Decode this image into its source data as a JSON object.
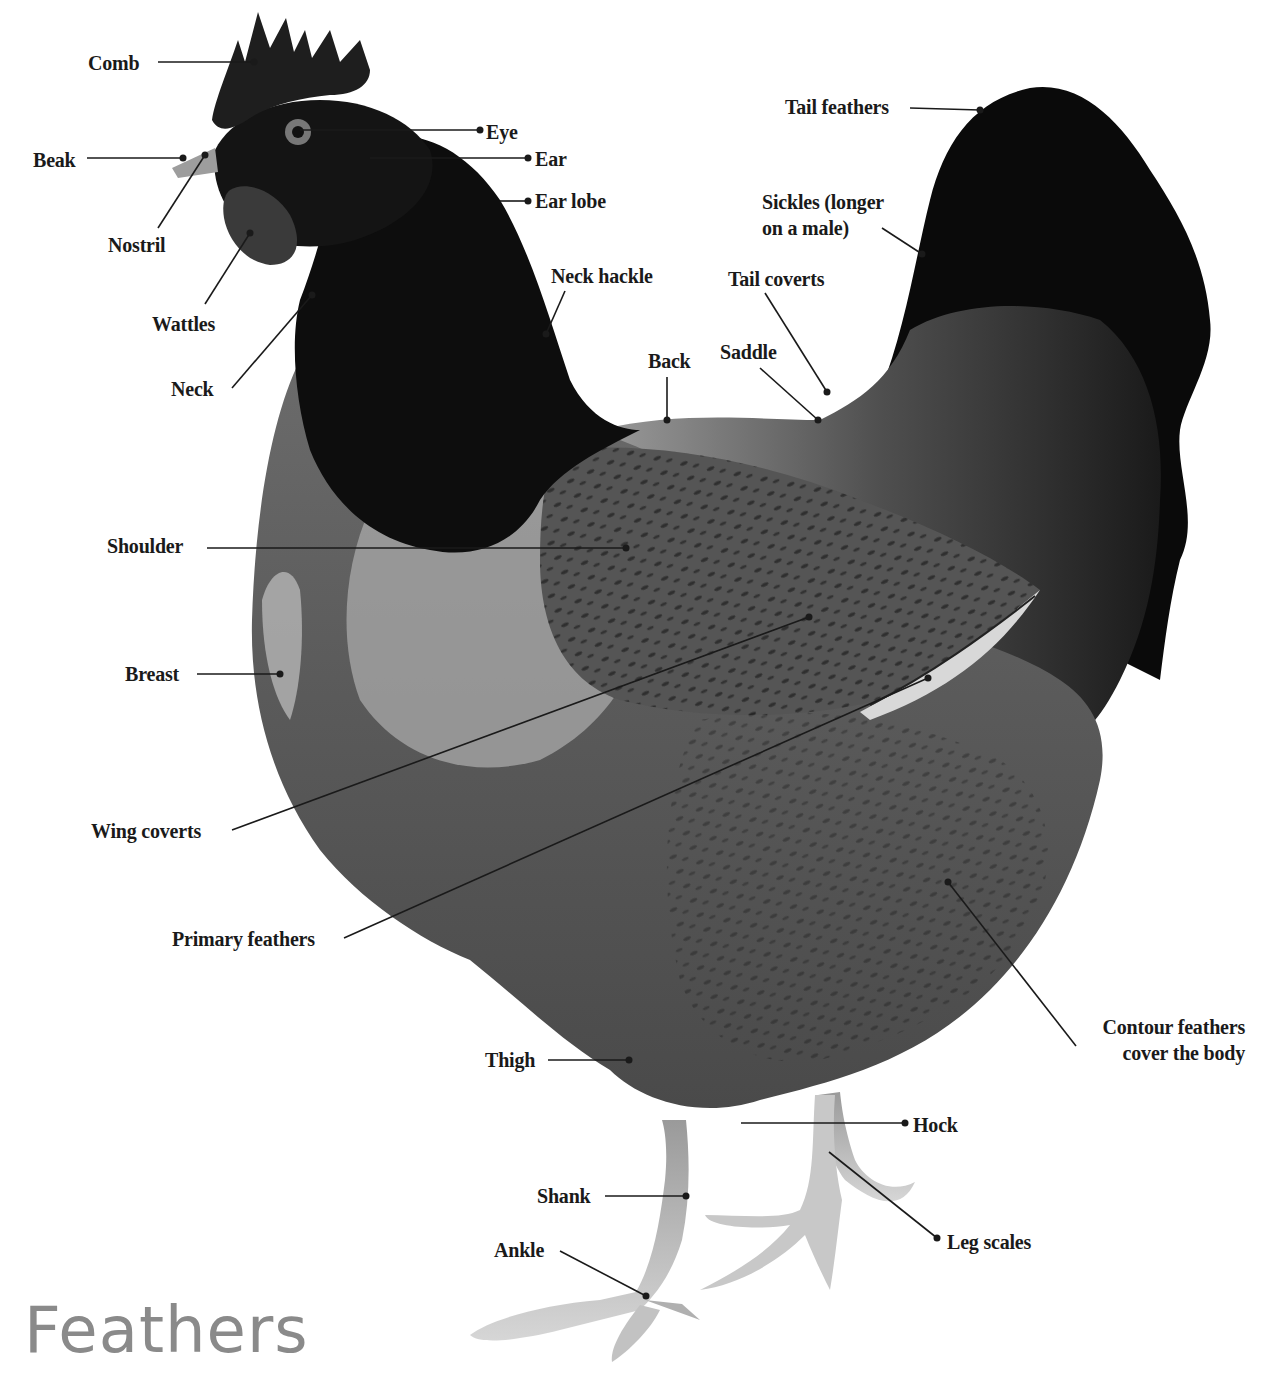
{
  "title": "Feathers",
  "colors": {
    "label_text": "#1a1a1a",
    "leader_line": "#1a1a1a",
    "title_text": "#8a8a8a",
    "background": "#ffffff",
    "plumage_dark": "#0d0d0d",
    "plumage_mid": "#4a4a4a",
    "plumage_light": "#8c8c8c",
    "legs": "#c8c8c8"
  },
  "labels": [
    {
      "id": "comb",
      "text": "Comb",
      "x": 88,
      "y": 50,
      "align": "left",
      "line": [
        [
          158,
          62
        ],
        [
          254,
          62
        ]
      ]
    },
    {
      "id": "beak",
      "text": "Beak",
      "x": 33,
      "y": 147,
      "align": "left",
      "line": [
        [
          87,
          158
        ],
        [
          183,
          158
        ]
      ]
    },
    {
      "id": "nostril",
      "text": "Nostril",
      "x": 108,
      "y": 232,
      "align": "left",
      "line": [
        [
          158,
          228
        ],
        [
          205,
          155
        ]
      ]
    },
    {
      "id": "wattles",
      "text": "Wattles",
      "x": 152,
      "y": 311,
      "align": "left",
      "line": [
        [
          205,
          304
        ],
        [
          250,
          233
        ]
      ]
    },
    {
      "id": "neck",
      "text": "Neck",
      "x": 171,
      "y": 376,
      "align": "left",
      "line": [
        [
          232,
          388
        ],
        [
          312,
          295
        ]
      ]
    },
    {
      "id": "eye",
      "text": "Eye",
      "x": 486,
      "y": 119,
      "align": "left",
      "line": [
        [
          300,
          130
        ],
        [
          480,
          130
        ]
      ]
    },
    {
      "id": "ear",
      "text": "Ear",
      "x": 535,
      "y": 146,
      "align": "left",
      "line": [
        [
          370,
          158
        ],
        [
          528,
          158
        ]
      ]
    },
    {
      "id": "ear-lobe",
      "text": "Ear lobe",
      "x": 535,
      "y": 188,
      "align": "left",
      "line": [
        [
          500,
          201
        ],
        [
          528,
          201
        ]
      ]
    },
    {
      "id": "neck-hackle",
      "text": "Neck hackle",
      "x": 551,
      "y": 263,
      "align": "left",
      "line": [
        [
          565,
          291
        ],
        [
          546,
          334
        ]
      ]
    },
    {
      "id": "back",
      "text": "Back",
      "x": 648,
      "y": 348,
      "align": "left",
      "line": [
        [
          667,
          377
        ],
        [
          667,
          420
        ]
      ]
    },
    {
      "id": "saddle",
      "text": "Saddle",
      "x": 720,
      "y": 339,
      "align": "left",
      "line": [
        [
          760,
          368
        ],
        [
          818,
          420
        ]
      ]
    },
    {
      "id": "tail-coverts",
      "text": "Tail coverts",
      "x": 728,
      "y": 266,
      "align": "left",
      "line": [
        [
          765,
          293
        ],
        [
          827,
          392
        ]
      ]
    },
    {
      "id": "sickles",
      "text": "Sickles (longer\non a male)",
      "x": 762,
      "y": 189,
      "align": "left",
      "line": [
        [
          882,
          228
        ],
        [
          922,
          254
        ]
      ]
    },
    {
      "id": "tail-feathers",
      "text": "Tail feathers",
      "x": 785,
      "y": 94,
      "align": "left",
      "line": [
        [
          910,
          108
        ],
        [
          980,
          110
        ]
      ]
    },
    {
      "id": "shoulder",
      "text": "Shoulder",
      "x": 107,
      "y": 533,
      "align": "left",
      "line": [
        [
          207,
          548
        ],
        [
          626,
          548
        ]
      ]
    },
    {
      "id": "breast",
      "text": "Breast",
      "x": 125,
      "y": 661,
      "align": "left",
      "line": [
        [
          197,
          674
        ],
        [
          280,
          674
        ]
      ]
    },
    {
      "id": "wing-coverts",
      "text": "Wing coverts",
      "x": 91,
      "y": 818,
      "align": "left",
      "line": [
        [
          232,
          830
        ],
        [
          809,
          617
        ]
      ]
    },
    {
      "id": "primary-feathers",
      "text": "Primary feathers",
      "x": 172,
      "y": 926,
      "align": "left",
      "line": [
        [
          344,
          938
        ],
        [
          928,
          678
        ]
      ]
    },
    {
      "id": "contour-feathers",
      "text": "Contour feathers\ncover the body",
      "x": 1040,
      "y": 1014,
      "align": "right",
      "width": 205,
      "line": [
        [
          1076,
          1046
        ],
        [
          948,
          882
        ]
      ]
    },
    {
      "id": "thigh",
      "text": "Thigh",
      "x": 485,
      "y": 1047,
      "align": "left",
      "line": [
        [
          548,
          1060
        ],
        [
          629,
          1060
        ]
      ]
    },
    {
      "id": "hock",
      "text": "Hock",
      "x": 913,
      "y": 1112,
      "align": "left",
      "line": [
        [
          741,
          1123
        ],
        [
          905,
          1123
        ]
      ]
    },
    {
      "id": "shank",
      "text": "Shank",
      "x": 537,
      "y": 1183,
      "align": "left",
      "line": [
        [
          605,
          1196
        ],
        [
          686,
          1196
        ]
      ]
    },
    {
      "id": "leg-scales",
      "text": "Leg scales",
      "x": 947,
      "y": 1229,
      "align": "left",
      "line": [
        [
          829,
          1152
        ],
        [
          937,
          1238
        ]
      ]
    },
    {
      "id": "ankle",
      "text": "Ankle",
      "x": 494,
      "y": 1237,
      "align": "left",
      "line": [
        [
          560,
          1251
        ],
        [
          646,
          1296
        ]
      ]
    }
  ]
}
